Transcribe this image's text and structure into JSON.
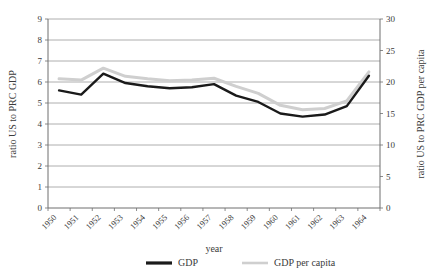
{
  "chart_data": {
    "type": "line",
    "title": "",
    "xlabel": "year",
    "ylabel": "ratio US to PRC GDP",
    "ylabel_right": "ratio US to PRC GDP per capita",
    "categories": [
      "1950",
      "1951",
      "1952",
      "1953",
      "1954",
      "1955",
      "1956",
      "1957",
      "1958",
      "1959",
      "1960",
      "1961",
      "1962",
      "1963",
      "1964"
    ],
    "ylim": [
      0,
      9
    ],
    "yticks": [
      "0",
      "1",
      "2",
      "3",
      "4",
      "5",
      "6",
      "7",
      "8",
      "9"
    ],
    "ylim_right": [
      0,
      30
    ],
    "yticks_right": [
      "0",
      "5",
      "10",
      "15",
      "20",
      "25",
      "30"
    ],
    "grid": true,
    "legend_position": "bottom",
    "series": [
      {
        "name": "GDP",
        "axis": "left",
        "color": "#1a1a1a",
        "values": [
          5.6,
          5.4,
          6.4,
          5.95,
          5.8,
          5.7,
          5.75,
          5.9,
          5.35,
          5.05,
          4.5,
          4.35,
          4.45,
          4.85,
          4.9
        ]
      },
      {
        "name": "GDP per capita",
        "axis": "right",
        "color": "#cccccc",
        "values": [
          20.5,
          20.3,
          22.2,
          20.9,
          20.5,
          20.2,
          20.3,
          20.6,
          19.3,
          18.2,
          16.3,
          15.6,
          15.8,
          17.0,
          17.2
        ]
      }
    ],
    "series_left_full": {
      "name": "GDP",
      "values": [
        5.6,
        5.4,
        6.4,
        5.95,
        5.8,
        5.7,
        5.75,
        5.9,
        5.35,
        5.05,
        4.5,
        4.35,
        4.45,
        4.85,
        4.9,
        7.8,
        7.85,
        7.1,
        6.3
      ]
    },
    "points_gdp": [
      {
        "x": "1950",
        "y": 5.6
      },
      {
        "x": "1951",
        "y": 5.4
      },
      {
        "x": "1952",
        "y": 6.4
      },
      {
        "x": "1953",
        "y": 5.95
      },
      {
        "x": "1954",
        "y": 5.8
      },
      {
        "x": "1955",
        "y": 5.7
      },
      {
        "x": "1956",
        "y": 5.75
      },
      {
        "x": "1957",
        "y": 5.9
      },
      {
        "x": "1958",
        "y": 5.35
      },
      {
        "x": "1959",
        "y": 5.05
      },
      {
        "x": "1960",
        "y": 4.5
      },
      {
        "x": "1961",
        "y": 4.35
      },
      {
        "x": "1962",
        "y": 4.45
      },
      {
        "x": "1963",
        "y": 4.85
      },
      {
        "x": "1964",
        "y": 6.3
      }
    ],
    "points_gdp_per_capita": [
      {
        "x": "1950",
        "y": 20.5
      },
      {
        "x": "1951",
        "y": 20.3
      },
      {
        "x": "1952",
        "y": 22.2
      },
      {
        "x": "1953",
        "y": 20.9
      },
      {
        "x": "1954",
        "y": 20.5
      },
      {
        "x": "1955",
        "y": 20.2
      },
      {
        "x": "1956",
        "y": 20.3
      },
      {
        "x": "1957",
        "y": 20.6
      },
      {
        "x": "1958",
        "y": 19.3
      },
      {
        "x": "1959",
        "y": 18.2
      },
      {
        "x": "1960",
        "y": 16.3
      },
      {
        "x": "1961",
        "y": 15.6
      },
      {
        "x": "1962",
        "y": 15.8
      },
      {
        "x": "1963",
        "y": 17.0
      },
      {
        "x": "1964",
        "y": 21.6
      }
    ]
  },
  "axes": {
    "left": {
      "title": "ratio US to PRC GDP",
      "ticks": [
        "0",
        "1",
        "2",
        "3",
        "4",
        "5",
        "6",
        "7",
        "8",
        "9"
      ]
    },
    "right": {
      "title": "ratio US to PRC GDP per capita",
      "ticks": [
        "0",
        "5",
        "10",
        "15",
        "20",
        "25",
        "30"
      ]
    },
    "x": {
      "title": "year",
      "ticks": [
        "1950",
        "1951",
        "1952",
        "1953",
        "1954",
        "1955",
        "1956",
        "1957",
        "1958",
        "1959",
        "1960",
        "1961",
        "1962",
        "1963",
        "1964"
      ]
    }
  },
  "legend": {
    "items": [
      {
        "label": "GDP",
        "color": "#1a1a1a"
      },
      {
        "label": "GDP per capita",
        "color": "#cfcfcf"
      }
    ]
  },
  "colors": {
    "gdp_line": "#1a1a1a",
    "gdp_per_capita_line": "#cfcfcf",
    "grid": "#9a9a9a",
    "axis": "#6e6e6e",
    "text": "#3b3b3b",
    "background": "#ffffff"
  }
}
